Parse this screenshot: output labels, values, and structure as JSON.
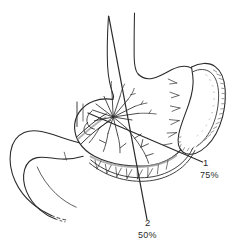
{
  "figure": {
    "background_color": "#ffffff",
    "ink_color": "#2b2b2b",
    "shade_color": "#8d8d8d",
    "width": 237,
    "height": 252
  },
  "labels": {
    "resection_1": {
      "number": "1",
      "percent": "75%"
    },
    "resection_2": {
      "number": "2",
      "percent": "50%"
    }
  },
  "structures": {
    "esophagus": "esophagus",
    "stomach": "stomach",
    "fundus": "gastric-fundus",
    "antrum": "gastric-antrum",
    "lesser_curvature": "lesser-curvature",
    "greater_curvature": "greater-curvature",
    "spleen": "spleen",
    "duodenum": "duodenum",
    "pancreas_vessels": "celiac-vascular-hub",
    "gastroepiploic_arcade": "gastroepiploic-arcade",
    "left_gastric_branches": "left-gastric-branches",
    "resection_line_1": "resection-line-75-percent",
    "resection_line_2": "resection-line-50-percent"
  }
}
